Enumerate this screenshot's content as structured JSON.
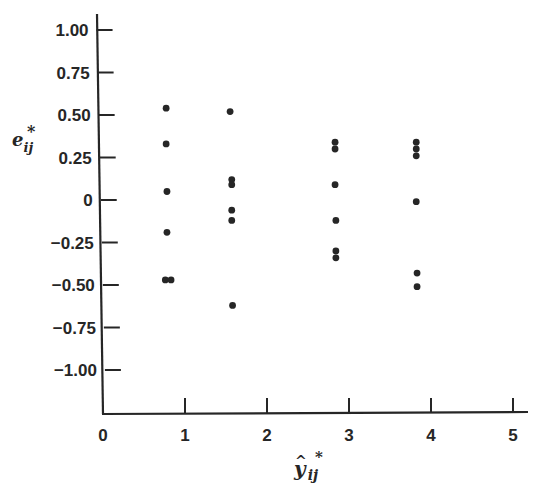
{
  "chart_data": {
    "type": "scatter",
    "title": "",
    "xlabel": "ŷ*ij",
    "ylabel": "e*ij",
    "xlabel_parts": {
      "base": "y",
      "accent": "^",
      "sub": "ij",
      "sup": "*"
    },
    "ylabel_parts": {
      "base": "e",
      "sub": "ij",
      "sup": "*"
    },
    "xlim": [
      0,
      5.2
    ],
    "ylim": [
      -1.25,
      1.1
    ],
    "grid": false,
    "legend": null,
    "x_ticks": [
      0,
      1,
      2,
      3,
      4,
      5
    ],
    "x_tick_labels": [
      "0",
      "1",
      "2",
      "3",
      "4",
      "5"
    ],
    "y_ticks": [
      1.0,
      0.75,
      0.5,
      0.25,
      0,
      -0.25,
      -0.5,
      -0.75,
      -1.0
    ],
    "y_tick_labels": [
      "1.00",
      "0.75",
      "0.50",
      "0.25",
      "0",
      "−0.25",
      "−0.50",
      "−0.75",
      "−1.00"
    ],
    "series": [
      {
        "name": "residuals",
        "points": [
          {
            "x": 0.77,
            "y": 0.54
          },
          {
            "x": 0.77,
            "y": 0.33
          },
          {
            "x": 0.78,
            "y": 0.05
          },
          {
            "x": 0.78,
            "y": -0.19
          },
          {
            "x": 0.76,
            "y": -0.47
          },
          {
            "x": 0.83,
            "y": -0.47
          },
          {
            "x": 1.55,
            "y": 0.52
          },
          {
            "x": 1.57,
            "y": 0.12
          },
          {
            "x": 1.57,
            "y": 0.09
          },
          {
            "x": 1.57,
            "y": -0.06
          },
          {
            "x": 1.57,
            "y": -0.12
          },
          {
            "x": 1.58,
            "y": -0.62
          },
          {
            "x": 2.83,
            "y": 0.34
          },
          {
            "x": 2.83,
            "y": 0.3
          },
          {
            "x": 2.83,
            "y": 0.09
          },
          {
            "x": 2.84,
            "y": -0.12
          },
          {
            "x": 2.84,
            "y": -0.3
          },
          {
            "x": 2.84,
            "y": -0.34
          },
          {
            "x": 3.82,
            "y": 0.34
          },
          {
            "x": 3.82,
            "y": 0.3
          },
          {
            "x": 3.82,
            "y": 0.26
          },
          {
            "x": 3.82,
            "y": -0.01
          },
          {
            "x": 3.83,
            "y": -0.43
          },
          {
            "x": 3.83,
            "y": -0.51
          }
        ]
      }
    ]
  },
  "colors": {
    "ink": "#262626",
    "background": "#ffffff"
  }
}
